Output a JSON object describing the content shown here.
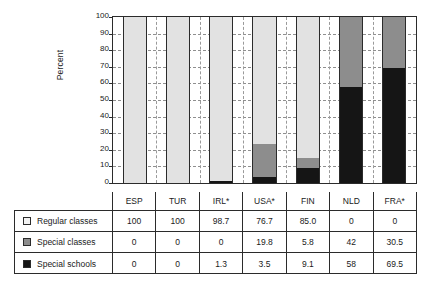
{
  "chart_data": {
    "type": "bar",
    "subtype": "stacked-100-percent",
    "title": "",
    "xlabel": "",
    "ylabel": "Percent",
    "ylim": [
      0,
      100
    ],
    "ytick_step": 10,
    "yticks": [
      100,
      90,
      80,
      70,
      60,
      50,
      40,
      30,
      20,
      10,
      0
    ],
    "grid": true,
    "grid_style": "dashed",
    "legend_position": "table-left",
    "categories": [
      "ESP",
      "TUR",
      "IRL*",
      "USA*",
      "FIN",
      "NLD",
      "FRA*"
    ],
    "series": [
      {
        "name": "Regular classes",
        "color": "#e2e2e2",
        "swatch": "sw-light",
        "values": [
          "100",
          "100",
          "98.7",
          "76.7",
          "85.0",
          "0",
          "0"
        ],
        "numeric": [
          100,
          100,
          98.7,
          76.7,
          85.0,
          0,
          0
        ]
      },
      {
        "name": "Special classes",
        "color": "#8d8d8d",
        "swatch": "sw-gray",
        "values": [
          "0",
          "0",
          "0",
          "19.8",
          "5.8",
          "42",
          "30.5"
        ],
        "numeric": [
          0,
          0,
          0,
          19.8,
          5.8,
          42,
          30.5
        ]
      },
      {
        "name": "Special schools",
        "color": "#151515",
        "swatch": "sw-black",
        "values": [
          "0",
          "0",
          "1.3",
          "3.5",
          "9.1",
          "58",
          "69.5"
        ],
        "numeric": [
          0,
          0,
          1.3,
          3.5,
          9.1,
          58,
          69.5
        ]
      }
    ]
  },
  "colors": {
    "regular_classes": "#e2e2e2",
    "special_classes": "#8d8d8d",
    "special_schools": "#151515",
    "axis": "#2b2b2b",
    "gridline": "#8f8f8f",
    "background": "#ffffff"
  }
}
